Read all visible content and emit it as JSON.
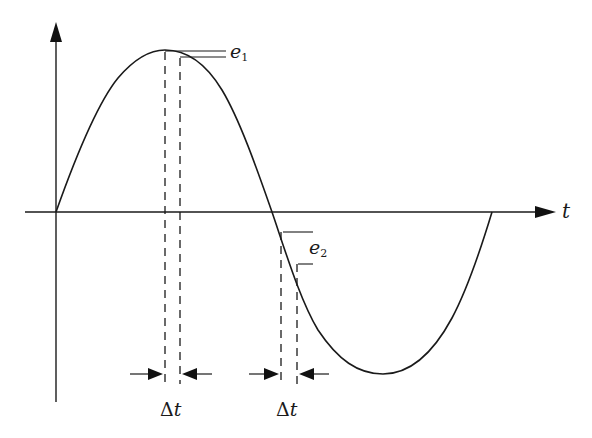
{
  "diagram": {
    "type": "sine-wave-sampling-error",
    "axis": {
      "x_label": "t",
      "y_label": ""
    },
    "curve": {
      "shape": "sine",
      "periods": 1,
      "start": [
        56,
        212
      ],
      "peak": [
        165,
        50
      ],
      "zero_crossing": [
        272,
        212
      ],
      "trough": [
        383,
        374
      ],
      "end": [
        492,
        212
      ]
    },
    "annotations": {
      "peak_error": {
        "symbol": "e",
        "subscript": "1",
        "location": "near peak"
      },
      "zero_crossing_error": {
        "symbol": "e",
        "subscript": "2",
        "location": "near zero crossing"
      },
      "interval_1": {
        "delta": "Δ",
        "var": "t"
      },
      "interval_2": {
        "delta": "Δ",
        "var": "t"
      }
    },
    "colors": {
      "line": "#1a1a1a",
      "background": "#ffffff"
    }
  }
}
